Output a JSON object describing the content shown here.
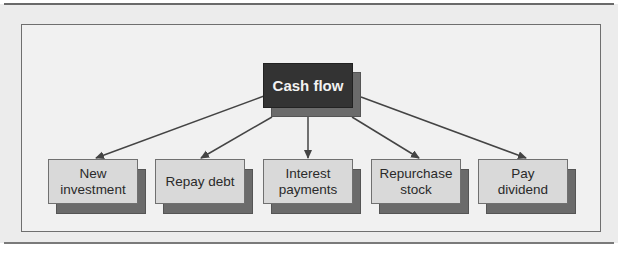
{
  "diagram": {
    "type": "tree",
    "root": {
      "label": "Cash flow"
    },
    "children": [
      {
        "label": "New\ninvestment"
      },
      {
        "label": "Repay debt"
      },
      {
        "label": "Interest\npayments"
      },
      {
        "label": "Repurchase\nstock"
      },
      {
        "label": "Pay\ndividend"
      }
    ],
    "colors": {
      "root_fill": "#333333",
      "root_text": "#f2f2f2",
      "child_fill": "#d9d9d9",
      "shadow": "#6b6b6b",
      "arrow": "#444444",
      "panel": "#f1f1f1"
    }
  }
}
